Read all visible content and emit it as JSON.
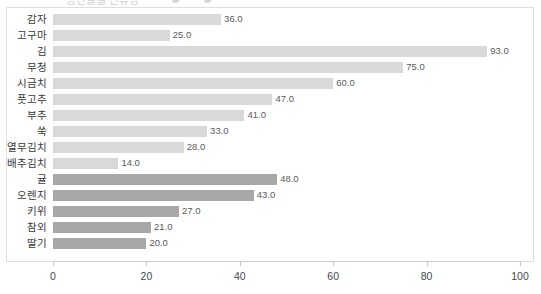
{
  "top_clip": {
    "title_text": "농산물별 잔류량",
    "dot_1": "marker-dot",
    "dot_2": "marker-dot"
  },
  "chart_data": {
    "type": "bar",
    "orientation": "horizontal",
    "title": "",
    "xlabel": "",
    "ylabel": "",
    "xlim": [
      0,
      100
    ],
    "xticks": [
      0,
      20,
      40,
      60,
      80,
      100
    ],
    "xtick_labels": [
      "0",
      "20",
      "40",
      "60",
      "80",
      "100"
    ],
    "grid": false,
    "legend": "none",
    "value_label_format": "one-decimal",
    "categories": [
      "감자",
      "고구마",
      "김",
      "무청",
      "시금치",
      "풋고추",
      "부추",
      "쑥",
      "열무김치",
      "배추김치",
      "귤",
      "오렌지",
      "키위",
      "참외",
      "딸기"
    ],
    "values": [
      36.0,
      25.0,
      93.0,
      75.0,
      60.0,
      47.0,
      41.0,
      33.0,
      28.0,
      14.0,
      48.0,
      43.0,
      27.0,
      21.0,
      20.0
    ],
    "value_labels": [
      "36.0",
      "25.0",
      "93.0",
      "75.0",
      "60.0",
      "47.0",
      "41.0",
      "33.0",
      "28.0",
      "14.0",
      "48.0",
      "43.0",
      "27.0",
      "21.0",
      "20.0"
    ],
    "bar_groups": [
      "light",
      "light",
      "light",
      "light",
      "light",
      "light",
      "light",
      "light",
      "light",
      "light",
      "dark",
      "dark",
      "dark",
      "dark",
      "dark"
    ],
    "colors": {
      "bar_light": "#d9d9d9",
      "bar_dark": "#a8a8a8",
      "axis": "#c9c9c9",
      "frame": "#dedede",
      "category_text": "#3a3a3a",
      "value_text": "#5a5a5a",
      "tick_text": "#4a4a4a",
      "background": "#ffffff"
    }
  }
}
